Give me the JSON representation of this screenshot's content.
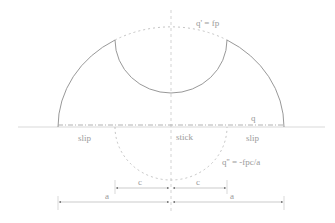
{
  "diagram": {
    "type": "contact-traction-distribution",
    "labels": {
      "q_prime": "q' = fp",
      "q": "q",
      "q_double_prime": "q'' = -fpc/a",
      "slip_left": "slip",
      "stick": "stick",
      "slip_right": "slip",
      "c_left": "c",
      "c_right": "c",
      "a_left": "a",
      "a_right": "a"
    },
    "colors": {
      "line": "#8c8c8c",
      "dashed": "#b5b5b5",
      "text": "#9a9a9a",
      "background": "#ffffff"
    }
  }
}
